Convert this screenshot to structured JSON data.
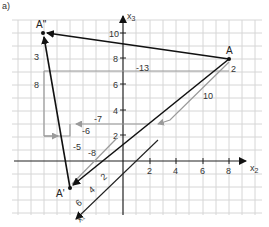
{
  "figure": {
    "corner_label": "a)",
    "axes": {
      "x3_label": "x",
      "x3_sub": "3",
      "x2_label": "x",
      "x2_sub": "2",
      "x1_label": "x",
      "x1_sub": "1",
      "x3_ticks": [
        "10",
        "8",
        "6",
        "4",
        "2"
      ],
      "x2_ticks": [
        "2",
        "4",
        "6",
        "8"
      ],
      "x1_ticks": [
        "2",
        "4",
        "6"
      ]
    },
    "points": {
      "A": "A",
      "A_prime": "A'",
      "A_double_prime": "A\""
    },
    "step_labels": {
      "a_x2": "2",
      "a_x1": "10",
      "a_x3": "-13",
      "left_3": "3",
      "left_8": "8",
      "m7": "-7",
      "m6": "-6",
      "m5": "-5",
      "m8": "-8"
    },
    "colors": {
      "grid": "#d4d4d4",
      "axis": "#222222",
      "vector": "#111111",
      "helper": "#9a9a9a"
    }
  }
}
